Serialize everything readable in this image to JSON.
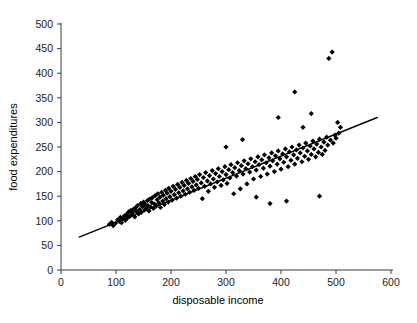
{
  "chart_data": {
    "type": "scatter",
    "title": "",
    "xlabel": "disposable income",
    "ylabel": "food expenditures",
    "xlim": [
      0,
      600
    ],
    "ylim": [
      0,
      500
    ],
    "xticks": [
      0,
      100,
      200,
      300,
      400,
      500,
      600
    ],
    "yticks": [
      0,
      50,
      100,
      150,
      200,
      250,
      300,
      350,
      400,
      450,
      500
    ],
    "grid": false,
    "legend": null,
    "marker": "diamond",
    "marker_color": "#000000",
    "series": [
      {
        "name": "observations",
        "x": [
          88,
          92,
          95,
          99,
          103,
          106,
          108,
          110,
          112,
          115,
          117,
          119,
          121,
          123,
          125,
          127,
          128,
          130,
          132,
          134,
          136,
          137,
          139,
          141,
          143,
          145,
          146,
          148,
          150,
          152,
          153,
          155,
          157,
          158,
          160,
          161,
          163,
          165,
          166,
          168,
          170,
          171,
          173,
          175,
          176,
          178,
          180,
          181,
          183,
          185,
          186,
          188,
          190,
          191,
          193,
          195,
          196,
          198,
          200,
          202,
          204,
          206,
          208,
          210,
          212,
          214,
          216,
          218,
          220,
          222,
          224,
          226,
          228,
          230,
          232,
          234,
          236,
          238,
          240,
          242,
          244,
          246,
          248,
          250,
          252,
          255,
          257,
          259,
          261,
          263,
          266,
          268,
          270,
          272,
          275,
          277,
          279,
          281,
          284,
          286,
          288,
          291,
          293,
          295,
          298,
          300,
          302,
          305,
          307,
          309,
          312,
          314,
          316,
          319,
          321,
          324,
          326,
          328,
          331,
          333,
          336,
          338,
          340,
          343,
          345,
          348,
          350,
          353,
          355,
          358,
          360,
          363,
          365,
          368,
          370,
          373,
          375,
          378,
          380,
          383,
          385,
          388,
          390,
          393,
          395,
          398,
          400,
          403,
          405,
          408,
          410,
          413,
          415,
          418,
          420,
          423,
          425,
          428,
          430,
          433,
          435,
          438,
          440,
          443,
          445,
          448,
          450,
          453,
          455,
          458,
          460,
          463,
          465,
          468,
          470,
          473,
          475,
          478,
          480,
          483,
          485,
          487,
          490,
          493,
          495,
          498,
          500,
          503,
          505,
          508,
          300,
          330,
          355,
          380,
          395,
          410,
          425,
          440,
          455,
          470
        ],
        "y": [
          93,
          97,
          90,
          95,
          102,
          99,
          107,
          96,
          104,
          110,
          101,
          113,
          106,
          118,
          109,
          121,
          112,
          116,
          124,
          108,
          127,
          119,
          131,
          114,
          123,
          135,
          117,
          129,
          138,
          122,
          133,
          126,
          141,
          131,
          120,
          144,
          128,
          137,
          147,
          125,
          134,
          151,
          130,
          143,
          155,
          136,
          148,
          127,
          158,
          140,
          152,
          133,
          162,
          145,
          156,
          138,
          166,
          149,
          160,
          142,
          170,
          153,
          164,
          146,
          174,
          157,
          168,
          150,
          178,
          161,
          172,
          154,
          182,
          165,
          176,
          158,
          186,
          169,
          180,
          162,
          190,
          173,
          184,
          166,
          194,
          177,
          145,
          188,
          170,
          198,
          181,
          160,
          192,
          175,
          202,
          185,
          168,
          196,
          179,
          206,
          190,
          172,
          200,
          183,
          210,
          194,
          176,
          204,
          187,
          214,
          198,
          155,
          208,
          191,
          218,
          202,
          165,
          212,
          195,
          222,
          206,
          175,
          216,
          199,
          226,
          210,
          185,
          220,
          203,
          230,
          214,
          190,
          224,
          207,
          234,
          218,
          195,
          228,
          211,
          238,
          222,
          200,
          232,
          215,
          242,
          226,
          205,
          236,
          219,
          246,
          230,
          210,
          240,
          223,
          250,
          234,
          215,
          244,
          227,
          254,
          238,
          220,
          248,
          231,
          258,
          242,
          225,
          252,
          235,
          262,
          246,
          230,
          256,
          239,
          266,
          250,
          235,
          260,
          243,
          270,
          254,
          430,
          264,
          443,
          258,
          274,
          268,
          300,
          278,
          290,
          250,
          265,
          148,
          135,
          310,
          140,
          362,
          290,
          318,
          150
        ]
      }
    ],
    "trend_line": {
      "type": "linear-fit",
      "x_start": 33,
      "y_start": 67,
      "x_end": 575,
      "y_end": 310
    }
  }
}
